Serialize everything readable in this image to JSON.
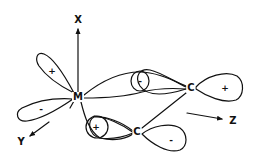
{
  "diagram": {
    "colors": {
      "line": "#111111",
      "background": "#ffffff"
    },
    "atoms": [
      {
        "id": "metal",
        "label": "M",
        "x": 78,
        "y": 97
      },
      {
        "id": "carbon-upper",
        "label": "C",
        "x": 191,
        "y": 88
      },
      {
        "id": "carbon-lower",
        "label": "C",
        "x": 137,
        "y": 132
      }
    ],
    "axes": [
      {
        "id": "x-axis",
        "label": "X",
        "label_x": 78,
        "label_y": 20
      },
      {
        "id": "y-axis",
        "label": "Y",
        "label_x": 21,
        "label_y": 142
      },
      {
        "id": "z-axis",
        "label": "Z",
        "label_x": 233,
        "label_y": 121
      }
    ],
    "lobe_signs": [
      {
        "id": "metal-upper-left-lobe",
        "sign": "+",
        "x": 52,
        "y": 71
      },
      {
        "id": "metal-left-lobe",
        "sign": "-",
        "x": 41,
        "y": 109
      },
      {
        "id": "metal-lower-lobe",
        "sign": "+",
        "x": 96,
        "y": 127
      },
      {
        "id": "pi-upper-overlap-lobe",
        "sign": "-",
        "x": 140,
        "y": 81
      },
      {
        "id": "carbon-upper-right-lobe",
        "sign": "+",
        "x": 225,
        "y": 88
      },
      {
        "id": "carbon-lower-right-lobe",
        "sign": "-",
        "x": 171,
        "y": 140
      }
    ]
  }
}
